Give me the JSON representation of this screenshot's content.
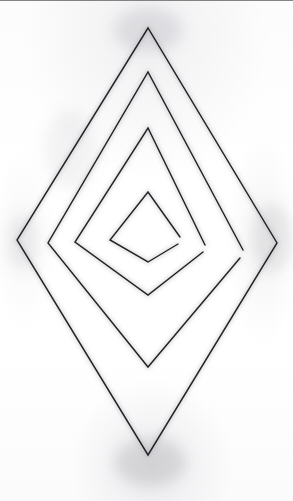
{
  "artwork": {
    "title": "Nested Diamond Spiral",
    "medium": "pencil sketch on paper",
    "subject": "four concentric rhombi forming an open spiral",
    "orientation": "portrait"
  },
  "canvas": {
    "width": 293,
    "height": 501,
    "background_color": "#fdfdfd",
    "paper_tone": "#ffffff",
    "top_border_color": "#6e6e70",
    "top_border_height": 1
  },
  "ink": {
    "stroke_color": "#242428",
    "stroke_width": 1.45,
    "shadow_color": "#9a9aa0",
    "shadow_opacity": 0.4,
    "line_style": "hand-drawn straight segments"
  },
  "geometry": {
    "center_x": 148,
    "center_y": 242,
    "ring_count": 4,
    "rings": [
      {
        "name": "ring-1-outer",
        "closed": true,
        "top": {
          "x": 148,
          "y": 28
        },
        "left": {
          "x": 17,
          "y": 240
        },
        "bottom": {
          "x": 148,
          "y": 455
        },
        "right": {
          "x": 277,
          "y": 243
        },
        "path": "M148,28 L17,240 L148,455 L277,243 Z"
      },
      {
        "name": "ring-2",
        "closed": false,
        "top": {
          "x": 148,
          "y": 72
        },
        "left": {
          "x": 48,
          "y": 243
        },
        "bottom": {
          "x": 148,
          "y": 367
        },
        "right": {
          "x": 243,
          "y": 250
        },
        "path": "M243,250 L148,72 L48,243 L148,367 L240,258"
      },
      {
        "name": "ring-3",
        "closed": false,
        "top": {
          "x": 148,
          "y": 128
        },
        "left": {
          "x": 75,
          "y": 242
        },
        "bottom": {
          "x": 148,
          "y": 295
        },
        "right": {
          "x": 205,
          "y": 245
        },
        "path": "M205,245 L148,128 L75,242 L148,295 L203,252"
      },
      {
        "name": "ring-4-inner",
        "closed": false,
        "top": {
          "x": 148,
          "y": 192
        },
        "left": {
          "x": 110,
          "y": 240
        },
        "bottom": {
          "x": 148,
          "y": 262
        },
        "right": {
          "x": 180,
          "y": 237
        },
        "path": "M180,237 L148,192 L110,240 L148,262 L178,244"
      }
    ],
    "spiral_tails": [
      {
        "name": "tail-ring-2",
        "from": {
          "x": 240,
          "y": 258
        },
        "to": {
          "x": 205,
          "y": 245
        }
      },
      {
        "name": "tail-ring-3",
        "from": {
          "x": 203,
          "y": 252
        },
        "to": {
          "x": 180,
          "y": 237
        }
      }
    ],
    "gaps": [
      {
        "name": "gap-inner-apex",
        "x": 148,
        "y": 192
      },
      {
        "name": "gap-right-ring2",
        "x": 243,
        "y": 250
      },
      {
        "name": "gap-right-ring3",
        "x": 205,
        "y": 245
      },
      {
        "name": "gap-right-ring4",
        "x": 180,
        "y": 237
      }
    ]
  },
  "smudges": [
    {
      "name": "smudge-top-apex",
      "x": 148,
      "y": 30,
      "rx": 34,
      "ry": 22,
      "opacity": 0.2
    },
    {
      "name": "smudge-bottom-apex",
      "x": 150,
      "y": 462,
      "rx": 36,
      "ry": 24,
      "opacity": 0.26
    },
    {
      "name": "smudge-right-vertex",
      "x": 272,
      "y": 238,
      "rx": 20,
      "ry": 34,
      "opacity": 0.18
    },
    {
      "name": "smudge-left-vertex",
      "x": 22,
      "y": 242,
      "rx": 16,
      "ry": 28,
      "opacity": 0.13
    },
    {
      "name": "smudge-upper-left",
      "x": 70,
      "y": 150,
      "rx": 26,
      "ry": 40,
      "opacity": 0.1
    }
  ]
}
